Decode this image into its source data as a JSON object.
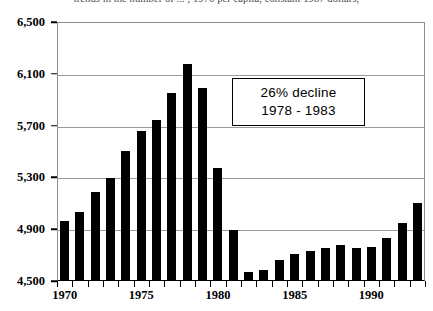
{
  "chart_title": "trends in the number of ... , 1970 per capita, constant 1987 dollars,",
  "annotation": {
    "line1": "26% decline",
    "line2": "1978 - 1983"
  },
  "axes": {
    "y_ticks": [
      "6,500",
      "6,100",
      "5,700",
      "5,300",
      "4,900",
      "4,500"
    ],
    "y_tick_values": [
      6500,
      6100,
      5700,
      5300,
      4900,
      4500
    ],
    "x_ticks": [
      "1970",
      "1975",
      "1980",
      "1985",
      "1990"
    ],
    "x_tick_values": [
      1970,
      1975,
      1980,
      1985,
      1990
    ]
  },
  "colors": {
    "bar": "#000000",
    "grid": "#9a9a9a",
    "axis": "#000000",
    "background": "#ffffff"
  },
  "chart_data": {
    "type": "bar",
    "title": "trends in the number of ... , 1970 per capita, constant 1987 dollars,",
    "xlabel": "",
    "ylabel": "",
    "ylim": [
      4500,
      6500
    ],
    "ytick_step": 400,
    "grid": true,
    "legend": null,
    "categories": [
      "1970",
      "1971",
      "1972",
      "1973",
      "1974",
      "1975",
      "1976",
      "1977",
      "1978",
      "1979",
      "1980",
      "1981",
      "1982",
      "1983",
      "1984",
      "1985",
      "1986",
      "1987",
      "1988",
      "1989",
      "1990",
      "1991",
      "1992",
      "1993"
    ],
    "values": [
      4955,
      5025,
      5180,
      5295,
      5500,
      5655,
      5745,
      5955,
      6180,
      5995,
      5370,
      4890,
      4565,
      4580,
      4655,
      4700,
      4725,
      4745,
      4770,
      4745,
      4760,
      4830,
      4940,
      5095
    ],
    "annotations": [
      {
        "text": "26% decline",
        "sub": "1978 - 1983",
        "x": 1983,
        "y": 6000
      }
    ]
  }
}
